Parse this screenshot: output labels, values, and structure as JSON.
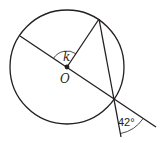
{
  "diagram": {
    "labels": {
      "angle_at_center": "k",
      "center": "O",
      "exterior_angle": "42°"
    },
    "geometry": {
      "circle": {
        "cx": 67,
        "cy": 67,
        "r": 57
      },
      "center_point": {
        "x": 67,
        "y": 67
      },
      "diameter_left_endpoint": {
        "x": 20,
        "y": 36
      },
      "top_point_on_circle": {
        "x": 99,
        "y": 19
      },
      "intersection_point_on_circle": {
        "x": 114,
        "y": 99
      },
      "secant_end": {
        "x": 156,
        "y": 127
      },
      "chord_extension_end": {
        "x": 121,
        "y": 137
      }
    },
    "colors": {
      "stroke": "#231f20",
      "background": "#ffffff"
    }
  }
}
